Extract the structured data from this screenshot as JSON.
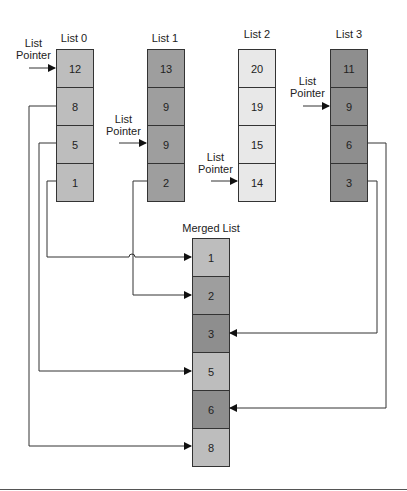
{
  "colors": {
    "shade_light": "#ebebeb",
    "shade_mid": "#bdbdbd",
    "shade_dark": "#9a9a9a",
    "shade_darker": "#8c8c8c",
    "line": "#333333"
  },
  "lists": [
    {
      "title": "List 0",
      "values": [
        "12",
        "8",
        "5",
        "1"
      ],
      "fill": "#bdbdbd"
    },
    {
      "title": "List 1",
      "values": [
        "13",
        "9",
        "9",
        "2"
      ],
      "fill": "#9e9e9e"
    },
    {
      "title": "List 2",
      "values": [
        "20",
        "19",
        "15",
        "14"
      ],
      "fill": "#e8e8e8"
    },
    {
      "title": "List 3",
      "values": [
        "11",
        "9",
        "6",
        "3"
      ],
      "fill": "#8e8e8e"
    }
  ],
  "pointer_label_line1": "List",
  "pointer_label_line2": "Pointer",
  "merged": {
    "title": "Merged List",
    "values": [
      "1",
      "2",
      "3",
      "5",
      "6",
      "8"
    ],
    "fills": [
      "#bdbdbd",
      "#9e9e9e",
      "#8e8e8e",
      "#bdbdbd",
      "#8e8e8e",
      "#bdbdbd"
    ]
  }
}
